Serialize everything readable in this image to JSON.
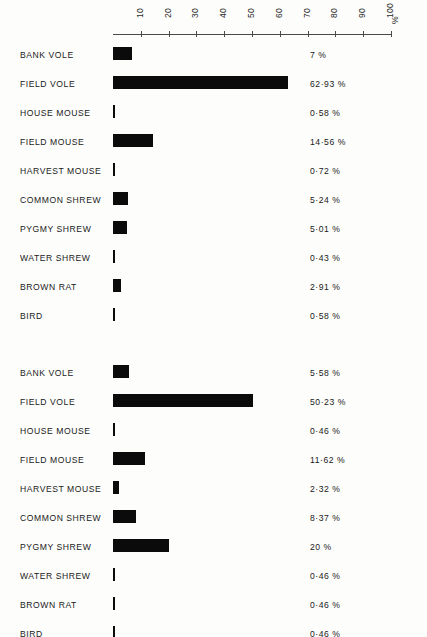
{
  "axis": {
    "unit_label": "%",
    "ticks": [
      10,
      20,
      30,
      40,
      50,
      60,
      70,
      80,
      90,
      100
    ],
    "tick_labels": [
      "10",
      "20",
      "30",
      "40",
      "50",
      "60",
      "70",
      "80",
      "90",
      "100"
    ],
    "min": 0,
    "max": 100,
    "pixels_per_percent": 2.78,
    "origin_px": 113
  },
  "chart_data": [
    {
      "type": "bar",
      "orientation": "horizontal",
      "title": "",
      "xlabel": "%",
      "ylabel": "",
      "xlim": [
        0,
        100
      ],
      "grid": false,
      "legend": "none",
      "categories": [
        "BANK VOLE",
        "FIELD VOLE",
        "HOUSE MOUSE",
        "FIELD MOUSE",
        "HARVEST MOUSE",
        "COMMON SHREW",
        "PYGMY SHREW",
        "WATER SHREW",
        "BROWN RAT",
        "BIRD"
      ],
      "values": [
        7,
        62.93,
        0.58,
        14.56,
        0.72,
        5.24,
        5.01,
        0.43,
        2.91,
        0.58
      ],
      "value_labels": [
        "7 %",
        "62·93 %",
        "0·58 %",
        "14·56 %",
        "0·72 %",
        "5·24 %",
        "5·01 %",
        "0·43 %",
        "2·91 %",
        "0·58 %"
      ]
    },
    {
      "type": "bar",
      "orientation": "horizontal",
      "title": "",
      "xlabel": "%",
      "ylabel": "",
      "xlim": [
        0,
        100
      ],
      "grid": false,
      "legend": "none",
      "categories": [
        "BANK VOLE",
        "FIELD VOLE",
        "HOUSE MOUSE",
        "FIELD MOUSE",
        "HARVEST MOUSE",
        "COMMON SHREW",
        "PYGMY SHREW",
        "WATER SHREW",
        "BROWN RAT",
        "BIRD"
      ],
      "values": [
        5.58,
        50.23,
        0.46,
        11.62,
        2.32,
        8.37,
        20,
        0.46,
        0.46,
        0.46
      ],
      "value_labels": [
        "5·58 %",
        "50·23 %",
        "0·46 %",
        "11·62 %",
        "2·32 %",
        "8·37 %",
        "20 %",
        "0·46 %",
        "0·46 %",
        "0·46 %"
      ]
    }
  ],
  "colors": {
    "bar": "#0b0b0b",
    "axis": "#4a4a4a",
    "text": "#1a1a1a",
    "background": "#fdfdfc"
  }
}
